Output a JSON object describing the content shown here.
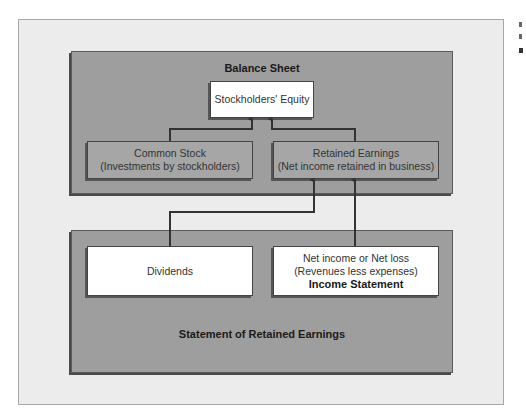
{
  "diagram": {
    "balance_sheet": {
      "title": "Balance Sheet",
      "stockholders_equity": "Stockholders' Equity",
      "common_stock": {
        "line1": "Common Stock",
        "line2": "(Investments by stockholders)"
      },
      "retained_earnings": {
        "line1": "Retained Earnings",
        "line2": "(Net income retained in business)"
      }
    },
    "statement_of_retained_earnings": {
      "title": "Statement of Retained Earnings",
      "dividends": "Dividends",
      "net_income": {
        "line1": "Net income or Net loss",
        "line2": "(Revenues less expenses)",
        "line3": "Income Statement"
      }
    },
    "connections": [
      {
        "from": "Common Stock",
        "to": "Stockholders' Equity"
      },
      {
        "from": "Retained Earnings",
        "to": "Stockholders' Equity"
      },
      {
        "from": "Dividends",
        "to": "Retained Earnings"
      },
      {
        "from": "Net income or Net loss",
        "to": "Retained Earnings"
      }
    ]
  }
}
